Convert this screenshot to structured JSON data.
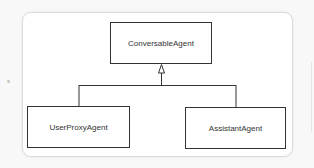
{
  "diagram": {
    "type": "uml-class-inheritance",
    "nodes": [
      {
        "id": "conversable",
        "label": "ConversableAgent",
        "role": "parent"
      },
      {
        "id": "userproxy",
        "label": "UserProxyAgent",
        "role": "child"
      },
      {
        "id": "assistant",
        "label": "AssistantAgent",
        "role": "child"
      }
    ],
    "edges": [
      {
        "from": "userproxy",
        "to": "conversable",
        "type": "generalization"
      },
      {
        "from": "assistant",
        "to": "conversable",
        "type": "generalization"
      }
    ],
    "colors": {
      "line": "#333333",
      "box_fill": "#ffffff",
      "frame_border": "#dcdcdc",
      "background": "#f8f8f8"
    }
  },
  "margin": {
    "left_glyph": "s"
  }
}
